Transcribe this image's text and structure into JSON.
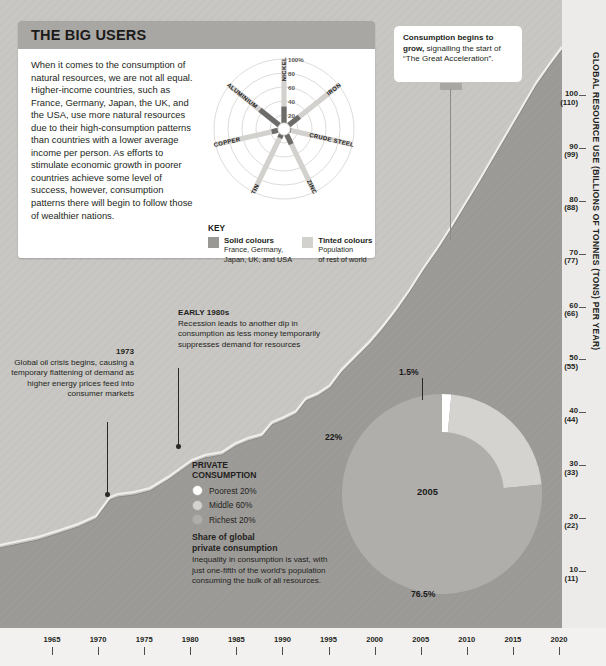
{
  "panel": {
    "title": "THE BIG USERS",
    "body": "When it comes to the consumption of natural resources, we are not all equal. Higher-income countries, such as France, Germany, Japan, the UK, and the USA, use more natural resources due to their high-consumption patterns than countries with a lower average income per person. As efforts to stimulate economic growth in poorer countries achieve some level of success, however, consumption patterns there will begin to follow those of wealthier nations."
  },
  "key": {
    "title": "KEY",
    "solid_title": "Solid colours",
    "solid_desc_1": "France, Germany,",
    "solid_desc_2": "Japan, UK, and USA",
    "tinted_title": "Tinted colours",
    "tinted_desc_1": "Population",
    "tinted_desc_2": "of rest of world",
    "solid_color": "#9a9895",
    "tinted_color": "#d3d1ce"
  },
  "callout": {
    "bold": "Consumption begins to grow,",
    "rest": " signalling the start of “The Great Acceleration”."
  },
  "annotations": [
    {
      "id": "1973",
      "heading": "1973",
      "body": "Global oil crisis begins, causing a temporary flattening of demand as higher energy prices feed into consumer markets"
    },
    {
      "id": "early-1980s",
      "heading": "EARLY 1980s",
      "body": "Recession leads to another dip in consumption as less money temporarily suppresses demand for resources"
    }
  ],
  "private_consumption": {
    "title_line1": "PRIVATE",
    "title_line2": "CONSUMPTION",
    "items": [
      {
        "label": "Poorest 20%",
        "color": "#ffffff"
      },
      {
        "label": "Middle 60%",
        "color": "#d5d3d0"
      },
      {
        "label": "Richest 20%",
        "color": "#b0aeab"
      }
    ],
    "sub_title_1": "Share of global",
    "sub_title_2": "private consumption",
    "sub_body": "Inequality in consumption is vast, with just one-fifth of the world’s population consuming the bulk of all resources."
  },
  "chart_data": [
    {
      "type": "area",
      "title": "Global resource use",
      "ylabel": "GLOBAL RESOURCE USE (BILLIONS OF TONNES (TONS) PER YEAR)",
      "xlabel": "",
      "xlim": [
        1963,
        2020
      ],
      "ylim": [
        0,
        110
      ],
      "grid": false,
      "x_ticks": [
        "1965",
        "1970",
        "1975",
        "1980",
        "1985",
        "1990",
        "1995",
        "2000",
        "2005",
        "2010",
        "2015",
        "2020"
      ],
      "y_ticks": [
        {
          "primary": "10",
          "secondary": "(11)"
        },
        {
          "primary": "20",
          "secondary": "(22)"
        },
        {
          "primary": "30",
          "secondary": "(33)"
        },
        {
          "primary": "40",
          "secondary": "(44)"
        },
        {
          "primary": "50",
          "secondary": "(55)"
        },
        {
          "primary": "60",
          "secondary": "(66)"
        },
        {
          "primary": "70",
          "secondary": "(77)"
        },
        {
          "primary": "80",
          "secondary": "(88)"
        },
        {
          "primary": "90",
          "secondary": "(99)"
        },
        {
          "primary": "100",
          "secondary": "(110)"
        }
      ],
      "x": [
        1965,
        1970,
        1973,
        1975,
        1980,
        1982,
        1985,
        1990,
        1995,
        2000,
        2005,
        2010,
        2015,
        2020
      ],
      "values": [
        22,
        28,
        32,
        32,
        38,
        38,
        42,
        48,
        52,
        58,
        68,
        82,
        95,
        105
      ],
      "area_color": "#9d9b98",
      "line_color": "#edecea",
      "background_color": "#c9c7c4"
    },
    {
      "type": "pie",
      "title": "Share of global private consumption",
      "center_label": "2005",
      "labels": [
        "1.5%",
        "22%",
        "76.5%"
      ],
      "values": [
        1.5,
        22,
        76.5
      ],
      "colors": [
        "#ffffff",
        "#d5d3d0",
        "#b0aeab"
      ],
      "legend": [
        "Poorest 20%",
        "Middle 60%",
        "Richest 20%"
      ],
      "legend_position": "left",
      "donut": true
    },
    {
      "type": "radar",
      "title": "Resource consumption share by material",
      "scale_labels": [
        "20",
        "40",
        "60",
        "80",
        "100%"
      ],
      "ylim": [
        0,
        100
      ],
      "categories": [
        "NICKEL",
        "IRON",
        "CRUDE STEEL",
        "ZINC",
        "TIN",
        "COPPER",
        "ALUMINIUM"
      ],
      "series": [
        {
          "name": "Solid colours — France, Germany, Japan, UK, and USA",
          "color": "#6e6c69",
          "values": [
            32,
            28,
            10,
            24,
            14,
            18,
            44
          ]
        },
        {
          "name": "Tinted colours — Population of rest of world",
          "color": "#d3d1ce",
          "values": [
            68,
            72,
            90,
            76,
            86,
            82,
            56
          ]
        }
      ]
    }
  ]
}
